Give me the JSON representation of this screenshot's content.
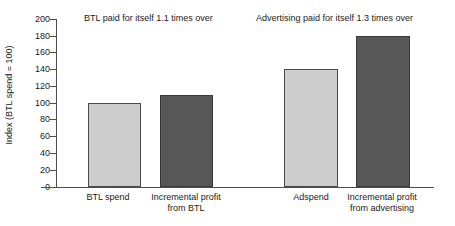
{
  "chart_data": {
    "type": "bar",
    "title": "",
    "xlabel": "",
    "ylabel": "Index (BTL spend = 100)",
    "ylim": [
      0,
      200
    ],
    "ytick_step": 20,
    "grid": false,
    "legend": "none",
    "categories": [
      "BTL spend",
      "Incremental profit\nfrom BTL",
      "Adspend",
      "Incremental profit\nfrom advertising"
    ],
    "values": [
      100,
      110,
      140,
      180
    ],
    "bar_colors": [
      "#cdcdcd",
      "#575757",
      "#cdcdcd",
      "#575757"
    ],
    "yticks": [
      "0",
      "20",
      "40",
      "60",
      "80",
      "100",
      "120",
      "140",
      "160",
      "180",
      "200"
    ],
    "annotations": [
      "BTL paid for itself 1.1 times over",
      "Advertising paid for itself 1.3 times over"
    ]
  },
  "axis": {
    "ylabel": "Index (BTL spend = 100)"
  },
  "annotations": {
    "left": "BTL paid for itself 1.1 times over",
    "right": "Advertising paid for itself 1.3 times over"
  },
  "categories": {
    "c0": "BTL spend",
    "c1": "Incremental profit\nfrom BTL",
    "c2": "Adspend",
    "c3": "Incremental profit\nfrom advertising"
  },
  "yticks": {
    "t0": "0",
    "t1": "20",
    "t2": "40",
    "t3": "60",
    "t4": "80",
    "t5": "100",
    "t6": "120",
    "t7": "140",
    "t8": "160",
    "t9": "180",
    "t10": "200"
  }
}
